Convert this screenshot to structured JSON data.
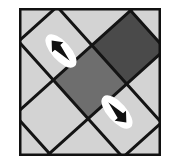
{
  "figure": {
    "title": "Rotated checkerboard tiling with two direction cursors",
    "type": "diagram",
    "canvas": {
      "width": 180,
      "height": 168,
      "background": "#ffffff"
    },
    "frame": {
      "name": "square-border",
      "x": 19,
      "y": 8,
      "width": 142,
      "height": 148,
      "stroke": "#111111",
      "stroke_width": 2.5,
      "fill": "#d3d3d3"
    },
    "grid": {
      "description": "Square checkerboard grid rotated about 45 degrees (tilted), clipped to the frame",
      "rotation_degrees": -42,
      "cell_size": 52,
      "line_color": "#141414",
      "line_width": 3,
      "origin_x": 90,
      "origin_y": 82
    },
    "tiles": [
      {
        "name": "tile-light-1",
        "shade": "light",
        "color": "#d3d3d3",
        "row": 0,
        "col": 0
      },
      {
        "name": "tile-light-2",
        "shade": "light",
        "color": "#d3d3d3",
        "row": 0,
        "col": 1
      },
      {
        "name": "tile-medium-dark",
        "shade": "medium-dark",
        "color": "#6e6e6e",
        "row": 1,
        "col": 0
      },
      {
        "name": "tile-dark",
        "shade": "dark",
        "color": "#4a4a4a",
        "row": 1,
        "col": 1
      },
      {
        "name": "tile-light-3",
        "shade": "light",
        "color": "#d3d3d3",
        "row": 2,
        "col": 0
      },
      {
        "name": "tile-light-4",
        "shade": "light",
        "color": "#d3d3d3",
        "row": 2,
        "col": 1
      }
    ],
    "palette": {
      "light_gray": "#d3d3d3",
      "medium_gray": "#6e6e6e",
      "dark_gray": "#4a4a4a",
      "line_black": "#141414",
      "halo_white": "#ffffff",
      "page_white": "#ffffff"
    },
    "cursors": [
      {
        "name": "cursor-upper-left",
        "label": "",
        "direction": "up-left",
        "angle_degrees": 228,
        "center_x": 61,
        "center_y": 51,
        "halo_color": "#ffffff",
        "arrow_color": "#111111",
        "length": 36,
        "halo_width": 15
      },
      {
        "name": "cursor-lower-right",
        "label": "",
        "direction": "down-right",
        "angle_degrees": 48,
        "center_x": 117,
        "center_y": 112,
        "halo_color": "#ffffff",
        "arrow_color": "#111111",
        "length": 36,
        "halo_width": 15
      }
    ]
  }
}
